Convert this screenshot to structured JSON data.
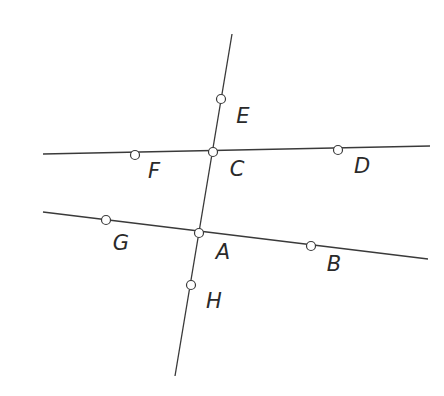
{
  "diagram": {
    "title": "",
    "colors": {
      "line": "#3a3a3a",
      "point_fill": "#ffffff",
      "label": "#2a2a2a"
    },
    "lines": [
      {
        "id": "EH",
        "x1": 232,
        "y1": 34,
        "x2": 175,
        "y2": 376
      },
      {
        "id": "FD",
        "x1": 43,
        "y1": 154,
        "x2": 430,
        "y2": 146
      },
      {
        "id": "GB",
        "x1": 43,
        "y1": 212,
        "x2": 428,
        "y2": 259
      }
    ],
    "points": [
      {
        "name": "E",
        "x": 221,
        "y": 99,
        "lx": 243,
        "ly": 117
      },
      {
        "name": "F",
        "x": 135,
        "y": 155,
        "lx": 154,
        "ly": 172
      },
      {
        "name": "C",
        "x": 213,
        "y": 152,
        "lx": 237,
        "ly": 170
      },
      {
        "name": "D",
        "x": 338,
        "y": 150,
        "lx": 362,
        "ly": 167
      },
      {
        "name": "G",
        "x": 106,
        "y": 220,
        "lx": 121,
        "ly": 244
      },
      {
        "name": "A",
        "x": 199,
        "y": 233,
        "lx": 223,
        "ly": 253
      },
      {
        "name": "B",
        "x": 311,
        "y": 246,
        "lx": 334,
        "ly": 265
      },
      {
        "name": "H",
        "x": 191,
        "y": 285,
        "lx": 214,
        "ly": 302
      }
    ]
  }
}
